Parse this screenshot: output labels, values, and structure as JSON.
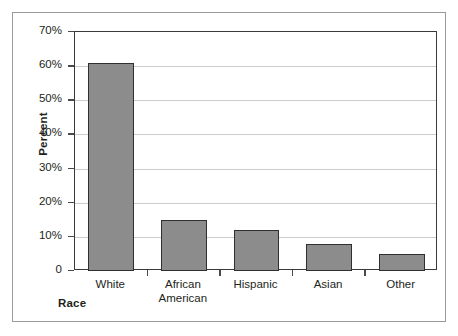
{
  "chart_data": {
    "type": "bar",
    "title": "",
    "xlabel": "Race",
    "ylabel": "Percent",
    "categories": [
      "White",
      "African American",
      "Hispanic",
      "Asian",
      "Other"
    ],
    "category_lines": [
      [
        "White"
      ],
      [
        "African",
        "American"
      ],
      [
        "Hispanic"
      ],
      [
        "Asian"
      ],
      [
        "Other"
      ]
    ],
    "values": [
      60.8,
      15.0,
      12.0,
      8.0,
      5.0
    ],
    "ylim": [
      0,
      70
    ],
    "ytick_values": [
      0,
      10,
      20,
      30,
      40,
      50,
      60,
      70
    ],
    "ytick_labels": [
      "0",
      "10%",
      "20%",
      "30%",
      "40%",
      "50%",
      "60%",
      "70%"
    ],
    "grid": true,
    "legend": "none",
    "bar_color": "#8c8c8c",
    "bar_border_color": "#2f2f2f",
    "gridline_color": "#cccccc",
    "axis_color": "#3a3a3a",
    "frame_color": "#9a9a9a",
    "background_color": "#ffffff"
  }
}
